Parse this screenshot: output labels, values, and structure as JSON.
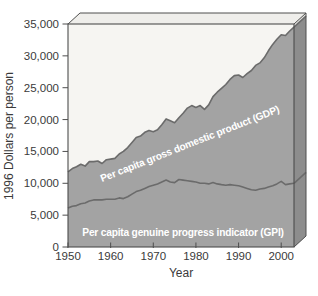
{
  "figure": {
    "y_ticks": [
      "35,000",
      "30,000",
      "25,000",
      "20,000",
      "15,000",
      "10,000",
      "5,000",
      "0"
    ],
    "y_tick_values": [
      35000,
      30000,
      25000,
      20000,
      15000,
      10000,
      5000,
      0
    ],
    "x_ticks": [
      "1950",
      "1960",
      "1970",
      "1980",
      "1990",
      "2000"
    ],
    "x_tick_values": [
      1950,
      1960,
      1970,
      1980,
      1990,
      2000
    ]
  },
  "chart_data": {
    "type": "area",
    "title": "",
    "xlabel": "Year",
    "ylabel": "1996 Dollars per person",
    "x_range": [
      1950,
      2003
    ],
    "ylim": [
      0,
      35000
    ],
    "grid": false,
    "legend_position": "labels-inside-plot",
    "x": [
      1950,
      1951,
      1952,
      1953,
      1954,
      1955,
      1956,
      1957,
      1958,
      1959,
      1960,
      1961,
      1962,
      1963,
      1964,
      1965,
      1966,
      1967,
      1968,
      1969,
      1970,
      1971,
      1972,
      1973,
      1974,
      1975,
      1976,
      1977,
      1978,
      1979,
      1980,
      1981,
      1982,
      1983,
      1984,
      1985,
      1986,
      1987,
      1988,
      1989,
      1990,
      1991,
      1992,
      1993,
      1994,
      1995,
      1996,
      1997,
      1998,
      1999,
      2000,
      2001,
      2002,
      2003
    ],
    "series": [
      {
        "name": "Per capita gross domestic product (GDP)",
        "values": [
          11800,
          12300,
          12600,
          13000,
          12700,
          13400,
          13400,
          13500,
          13100,
          13700,
          13800,
          13900,
          14600,
          15000,
          15600,
          16400,
          17200,
          17400,
          18000,
          18300,
          18100,
          18400,
          19200,
          20100,
          19800,
          19500,
          20300,
          21000,
          21800,
          22200,
          21900,
          22200,
          21600,
          22300,
          23600,
          24300,
          24900,
          25500,
          26300,
          26900,
          27000,
          26600,
          27200,
          27700,
          28500,
          28900,
          29700,
          30800,
          31800,
          32600,
          33300,
          33200,
          33900,
          34500
        ]
      },
      {
        "name": "Per capita genuine progress indicator (GPI)",
        "values": [
          6100,
          6400,
          6500,
          6800,
          6900,
          7200,
          7400,
          7400,
          7400,
          7500,
          7500,
          7500,
          7700,
          7600,
          7900,
          8300,
          8700,
          8900,
          9200,
          9500,
          9700,
          9900,
          10200,
          10500,
          10200,
          10100,
          10600,
          10500,
          10400,
          10300,
          10200,
          10000,
          10000,
          9900,
          10100,
          9900,
          9800,
          9700,
          9800,
          9700,
          9600,
          9400,
          9200,
          9000,
          8900,
          9100,
          9200,
          9400,
          9600,
          9900,
          10300,
          9800,
          9900,
          10000
        ]
      }
    ],
    "colors": {
      "area_fill": "#a3a3a3",
      "area_side_fill": "#8d8d8d",
      "line": "#6b6b6b",
      "plot_background": "#f6f5f2",
      "side_background": "#e4e3e0",
      "top_face": "#efeeeb",
      "frame": "#4e4e4e",
      "tick_text": "#3a3a3a",
      "series_label_text": "#ffffff"
    }
  }
}
